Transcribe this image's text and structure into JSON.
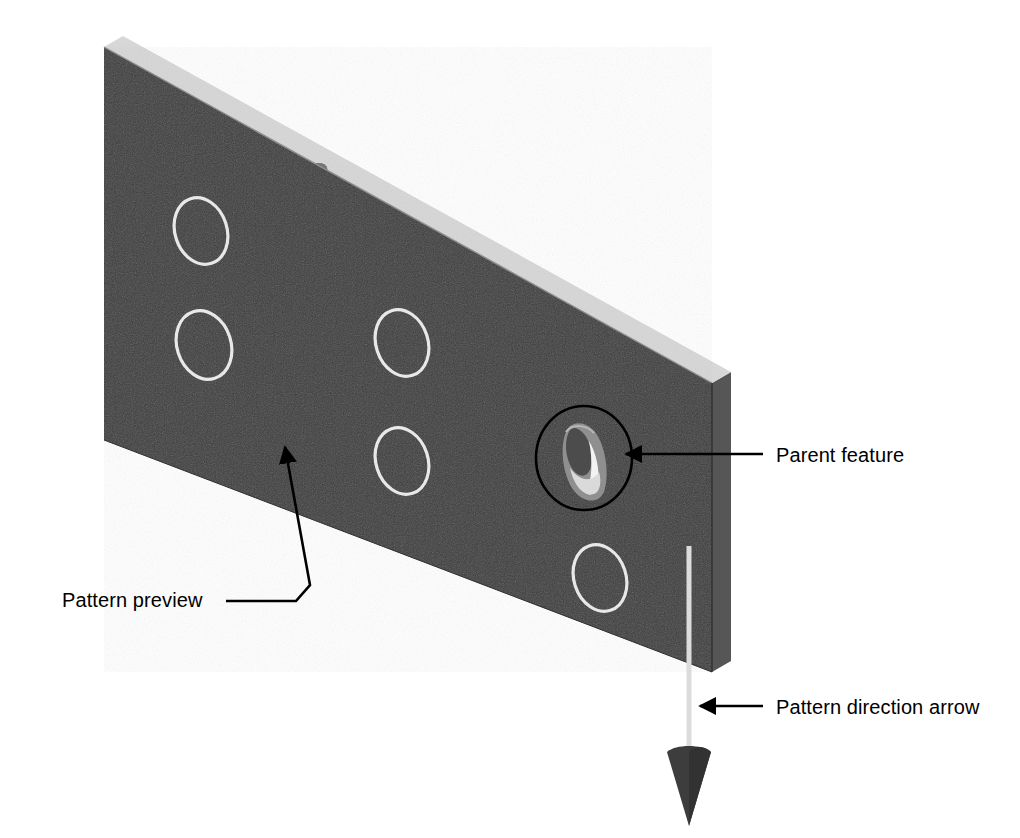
{
  "illustration": {
    "title": "Pattern preview of a hole feature on a plate",
    "subject": "linear pattern of holes on a rectangular plate in isometric view"
  },
  "callouts": [
    {
      "id": "pattern-preview",
      "label": "Pattern preview",
      "points_to": "white dashed preview circles on the plate face",
      "leader": "elbow-with-arrowhead"
    },
    {
      "id": "parent-feature",
      "label": "Parent feature",
      "points_to": "the existing drilled hole circled on the plate face",
      "leader": "straight-with-arrowhead"
    },
    {
      "id": "pattern-direction-arrow",
      "label": "Pattern direction arrow",
      "points_to": "vertical direction arrow along the right edge of the plate",
      "leader": "straight-with-arrowhead"
    }
  ],
  "model": {
    "part_name": "plate",
    "face_color": "#3b3b3b",
    "side_face_color": "#555555",
    "top_face_color": "#d9d9d9",
    "preview_outline_color": "#e8e8e8",
    "highlight_ring_color": "#000000",
    "direction_arrow_color": "#d9d9d9",
    "arrowhead_color": "#3b3b3b",
    "background_color": "#ffffff",
    "preview_instance_count": 5,
    "parent_feature_count": 1,
    "total_pattern_instances": 6
  },
  "preview_holes": [
    {
      "cx": 201,
      "cy": 231,
      "rx": 26,
      "ry": 34,
      "rot": -18
    },
    {
      "cx": 204,
      "cy": 345,
      "rx": 27,
      "ry": 35,
      "rot": -18
    },
    {
      "cx": 402,
      "cy": 343,
      "rx": 26,
      "ry": 34,
      "rot": -18
    },
    {
      "cx": 402,
      "cy": 461,
      "rx": 26,
      "ry": 34,
      "rot": -18
    },
    {
      "cx": 600,
      "cy": 578,
      "rx": 26,
      "ry": 34,
      "rot": -18
    }
  ],
  "parent_feature": {
    "cx": 584,
    "cy": 458,
    "ring_rx": 48,
    "ring_ry": 52,
    "hole_rx": 19,
    "hole_ry": 28
  }
}
